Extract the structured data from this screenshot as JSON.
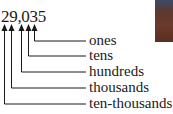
{
  "diagram": {
    "number": "29,035",
    "labels": [
      {
        "text": "ones",
        "digit": "5"
      },
      {
        "text": "tens",
        "digit": "3"
      },
      {
        "text": "hundreds",
        "digit": "0"
      },
      {
        "text": "thousands",
        "digit": "9"
      },
      {
        "text": "ten-thousands",
        "digit": "2"
      }
    ],
    "line_color": "#1a1a1a",
    "photo": "cropped-photo"
  }
}
